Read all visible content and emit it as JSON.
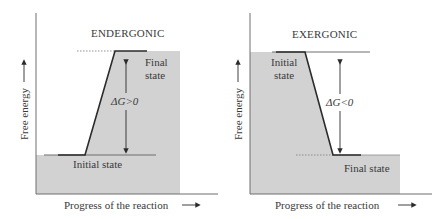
{
  "colors": {
    "shade": "#d2d2d2",
    "axis": "#6e6e6e",
    "line": "#2b2b2b",
    "thin": "#8a8a8a",
    "text": "#3a3a3a"
  },
  "panels": [
    {
      "id": "endergonic",
      "title": "ENDERGONIC",
      "upper_state_label": [
        "Final",
        "state"
      ],
      "lower_state_label": "Initial state",
      "delta_g_label": "ΔG>0",
      "y_axis_label": "Free energy",
      "x_axis_label": "Progress of the reaction",
      "direction": "up"
    },
    {
      "id": "exergonic",
      "title": "EXERGONIC",
      "upper_state_label": [
        "Initial",
        "state"
      ],
      "lower_state_label": "Final state",
      "delta_g_label": "ΔG<0",
      "y_axis_label": "Free energy",
      "x_axis_label": "Progress of the reaction",
      "direction": "down"
    }
  ]
}
